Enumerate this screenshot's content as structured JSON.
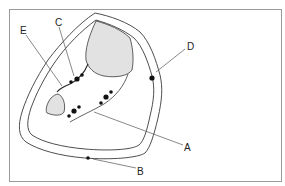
{
  "diagram": {
    "type": "cross-section",
    "colors": {
      "outline": "#3a3a3a",
      "fill_gray": "#e2e2e2",
      "dot": "#111111",
      "border": "#9a9a9a",
      "background": "#ffffff"
    },
    "labels": {
      "a": "A",
      "b": "B",
      "c": "C",
      "d": "D",
      "e": "E"
    }
  }
}
